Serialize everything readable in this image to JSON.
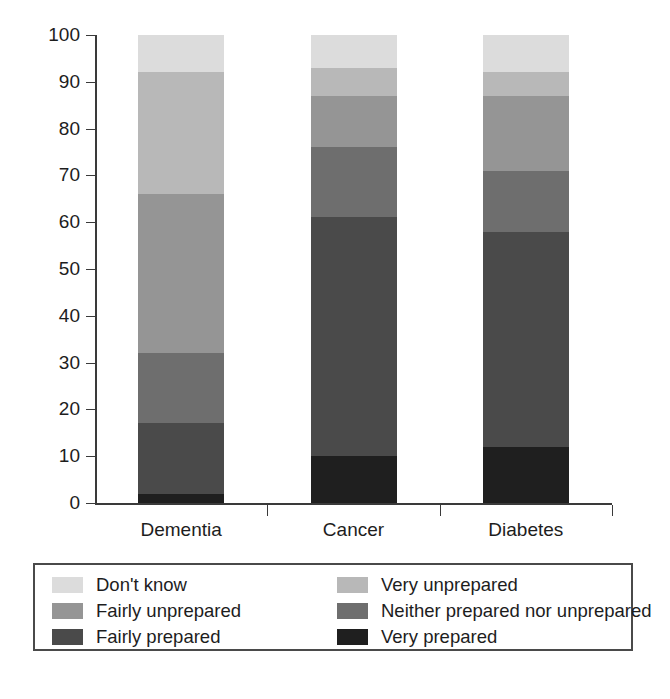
{
  "chart_data": {
    "type": "bar",
    "subtype": "stacked-bar-100-percent",
    "title": "",
    "subtitle": "",
    "xlabel": "",
    "ylabel": "",
    "ylim": [
      0,
      100
    ],
    "y_ticks": [
      0,
      10,
      20,
      30,
      40,
      50,
      60,
      70,
      80,
      90,
      100
    ],
    "y_tick_labels": [
      "0",
      "10",
      "20",
      "30",
      "40",
      "50",
      "60",
      "70",
      "80",
      "90",
      "100"
    ],
    "grid": false,
    "legend_position": "bottom",
    "legend_columns": 2,
    "categories": [
      "Dementia",
      "Cancer",
      "Diabetes"
    ],
    "stack_order_bottom_to_top": [
      "Very prepared",
      "Fairly prepared",
      "Neither prepared nor unprepared",
      "Fairly unprepared",
      "Very unprepared",
      "Don't know"
    ],
    "series": [
      {
        "name": "Very prepared",
        "color": "#1f1f1f",
        "values": [
          2,
          10,
          12
        ]
      },
      {
        "name": "Fairly prepared",
        "color": "#4a4a4a",
        "values": [
          15,
          51,
          46
        ]
      },
      {
        "name": "Neither prepared nor unprepared",
        "color": "#6e6e6e",
        "values": [
          15,
          15,
          13
        ]
      },
      {
        "name": "Fairly unprepared",
        "color": "#959595",
        "values": [
          34,
          11,
          16
        ]
      },
      {
        "name": "Very unprepared",
        "color": "#b8b8b8",
        "values": [
          26,
          6,
          5
        ]
      },
      {
        "name": "Don't know",
        "color": "#dcdcdc",
        "values": [
          8,
          7,
          8
        ]
      }
    ],
    "cumulative_tops": {
      "Dementia": [
        2,
        17,
        32,
        66,
        92,
        100
      ],
      "Cancer": [
        10,
        61,
        76,
        87,
        93,
        100
      ],
      "Diabetes": [
        12,
        58,
        71,
        87,
        92,
        100
      ]
    }
  },
  "legend": {
    "items": [
      {
        "label": "Don't know",
        "color": "#dcdcdc"
      },
      {
        "label": "Very unprepared",
        "color": "#b8b8b8"
      },
      {
        "label": "Fairly unprepared",
        "color": "#959595"
      },
      {
        "label": "Neither prepared nor unprepared",
        "color": "#6e6e6e"
      },
      {
        "label": "Fairly prepared",
        "color": "#4a4a4a"
      },
      {
        "label": "Very prepared",
        "color": "#1f1f1f"
      }
    ]
  },
  "axis": {
    "line_color": "#3a3a3a",
    "text_color": "#1d1d1d"
  }
}
